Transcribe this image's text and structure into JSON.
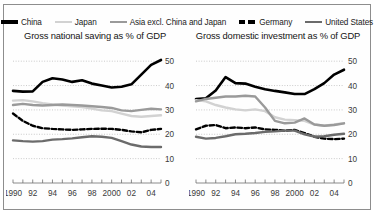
{
  "legend": {
    "items": [
      {
        "label": "China",
        "icon": "line-swatch-solid-black",
        "color": "#000000",
        "style": "solid"
      },
      {
        "label": "Japan",
        "icon": "line-swatch-solid-light",
        "color": "#d2d2d2",
        "style": "solid"
      },
      {
        "label": "Asia excl. China and Japan",
        "icon": "line-swatch-solid-grey",
        "color": "#9a9a9a",
        "style": "solid"
      },
      {
        "label": "Germany",
        "icon": "line-swatch-dashed-black",
        "color": "#000000",
        "style": "dashed"
      },
      {
        "label": "United States",
        "icon": "line-swatch-solid-darkgrey",
        "color": "#6b6b6b",
        "style": "solid"
      }
    ]
  },
  "chart_data": [
    {
      "type": "line",
      "title": "Gross national saving as % of GDP",
      "xlabel": "",
      "ylabel": "",
      "ylim": [
        0,
        55
      ],
      "yticks": [
        0,
        10,
        20,
        30,
        40,
        50
      ],
      "ytick_labels": [
        "0",
        "10",
        "20",
        "30",
        "40",
        "50"
      ],
      "grid": true,
      "axis_position": "right",
      "legend_position": "top",
      "x": [
        1990,
        1991,
        1992,
        1993,
        1994,
        1995,
        1996,
        1997,
        1998,
        1999,
        2000,
        2001,
        2002,
        2003,
        2004,
        2005
      ],
      "xtick_values": [
        1990,
        1992,
        1994,
        1996,
        1998,
        2000,
        2002,
        2004
      ],
      "xtick_labels": [
        "1990",
        "92",
        "94",
        "96",
        "98",
        "2000",
        "02",
        "04"
      ],
      "series": [
        {
          "name": "China",
          "color": "#000000",
          "style": "solid",
          "width": 2.6,
          "values": [
            37.8,
            37.5,
            37.6,
            41.5,
            43.0,
            42.5,
            41.5,
            42.2,
            40.8,
            40.0,
            39.2,
            39.5,
            40.5,
            44.5,
            48.5,
            50.5
          ]
        },
        {
          "name": "Japan",
          "color": "#d2d2d2",
          "style": "solid",
          "width": 2.4,
          "values": [
            33.8,
            34.0,
            33.5,
            32.8,
            32.2,
            31.8,
            31.5,
            31.2,
            30.5,
            29.8,
            29.5,
            28.5,
            27.5,
            27.2,
            27.5,
            27.8
          ]
        },
        {
          "name": "Asia excl. China and Japan",
          "color": "#9a9a9a",
          "style": "solid",
          "width": 2.4,
          "values": [
            32.0,
            32.5,
            32.0,
            31.8,
            32.0,
            32.2,
            32.0,
            31.8,
            31.5,
            31.2,
            30.8,
            29.8,
            29.5,
            30.0,
            30.5,
            30.2
          ]
        },
        {
          "name": "Germany",
          "color": "#000000",
          "style": "dashed",
          "width": 2.4,
          "values": [
            28.5,
            25.5,
            23.5,
            22.5,
            22.2,
            22.0,
            21.8,
            22.0,
            22.2,
            22.3,
            22.2,
            21.8,
            21.2,
            20.8,
            21.8,
            22.2
          ]
        },
        {
          "name": "United States",
          "color": "#6b6b6b",
          "style": "solid",
          "width": 2.4,
          "values": [
            17.5,
            17.2,
            17.0,
            17.2,
            17.8,
            18.0,
            18.3,
            18.8,
            19.2,
            19.0,
            18.5,
            17.2,
            15.8,
            15.0,
            14.8,
            14.8
          ]
        }
      ]
    },
    {
      "type": "line",
      "title": "Gross domestic investment as % of GDP",
      "xlabel": "",
      "ylabel": "",
      "ylim": [
        0,
        55
      ],
      "yticks": [
        0,
        10,
        20,
        30,
        40,
        50
      ],
      "ytick_labels": [
        "0",
        "10",
        "20",
        "30",
        "40",
        "50"
      ],
      "grid": true,
      "axis_position": "right",
      "legend_position": "top",
      "x": [
        1990,
        1991,
        1992,
        1993,
        1994,
        1995,
        1996,
        1997,
        1998,
        1999,
        2000,
        2001,
        2002,
        2003,
        2004,
        2005
      ],
      "xtick_values": [
        1990,
        1992,
        1994,
        1996,
        1998,
        2000,
        2002,
        2004
      ],
      "xtick_labels": [
        "1990",
        "92",
        "94",
        "96",
        "98",
        "2000",
        "02",
        "04"
      ],
      "series": [
        {
          "name": "China",
          "color": "#000000",
          "style": "solid",
          "width": 2.6,
          "values": [
            34.5,
            34.8,
            38.0,
            43.5,
            41.0,
            40.8,
            39.5,
            38.5,
            37.8,
            37.2,
            36.5,
            36.5,
            38.5,
            41.0,
            44.5,
            46.5
          ]
        },
        {
          "name": "Japan",
          "color": "#d2d2d2",
          "style": "solid",
          "width": 2.4,
          "values": [
            34.0,
            33.5,
            32.0,
            31.0,
            30.2,
            29.8,
            30.2,
            29.5,
            27.0,
            26.0,
            25.8,
            25.5,
            24.0,
            23.5,
            24.0,
            24.5
          ]
        },
        {
          "name": "Asia excl. China and Japan",
          "color": "#9a9a9a",
          "style": "solid",
          "width": 2.4,
          "values": [
            33.5,
            34.5,
            35.0,
            35.5,
            35.5,
            35.8,
            35.5,
            31.0,
            25.5,
            24.5,
            24.8,
            26.5,
            24.0,
            23.5,
            23.8,
            24.5
          ]
        },
        {
          "name": "Germany",
          "color": "#000000",
          "style": "dashed",
          "width": 2.4,
          "values": [
            22.0,
            23.5,
            23.8,
            22.5,
            22.8,
            22.5,
            22.8,
            22.0,
            21.8,
            21.5,
            21.8,
            20.5,
            19.0,
            18.2,
            18.0,
            18.2
          ]
        },
        {
          "name": "United States",
          "color": "#6b6b6b",
          "style": "solid",
          "width": 2.4,
          "values": [
            19.0,
            18.2,
            18.5,
            19.2,
            20.0,
            20.2,
            20.5,
            21.0,
            21.2,
            21.5,
            21.5,
            20.0,
            19.0,
            19.2,
            19.8,
            20.2
          ]
        }
      ]
    }
  ]
}
